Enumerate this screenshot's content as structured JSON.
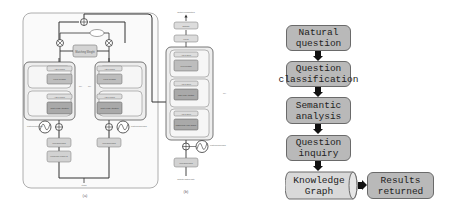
{
  "figure_a": {
    "caption": "(a)",
    "encoder_blocks": {
      "add_norm": "Add & Norm",
      "feed_forward": "Feed Forward",
      "attention": "Multi-Head Attention",
      "input_embedding": "Input Embedding",
      "knowledge": "Knowledge Feature Ø",
      "positional_encoding": "Positional Encoding"
    },
    "merge_block": "Matching Weight",
    "repeat_marker": "N×",
    "bottom_label": "Items"
  },
  "figure_b": {
    "caption": "(b)",
    "output_label": "Output Probabilities",
    "softmax": "Softmax",
    "linear": "Linear",
    "add_norm": "Add & Norm",
    "feed_forward": "Feed Forward",
    "attention_1": "Multi-Head Attention",
    "attention_2": "Masked Multi-Head Attention",
    "input_embedding": "Input Embedding",
    "positional_encoding": "Positional Encoding",
    "input_label": "Outputs (shifted right)",
    "repeat_marker": "N×"
  },
  "flowchart": {
    "steps": [
      {
        "line1": "Natural",
        "line2": "question"
      },
      {
        "line1": "Question",
        "line2": "classification"
      },
      {
        "line1": "Semantic",
        "line2": "analysis"
      },
      {
        "line1": "Question",
        "line2": "inquiry"
      }
    ],
    "knowledge_graph": {
      "line1": "Knowledge",
      "line2": "Graph"
    },
    "results": {
      "line1": "Results",
      "line2": "returned"
    },
    "colors": {
      "box_gray": "#b9b9b9",
      "box_light": "#d9d9d9",
      "arrow": "#111111"
    }
  }
}
